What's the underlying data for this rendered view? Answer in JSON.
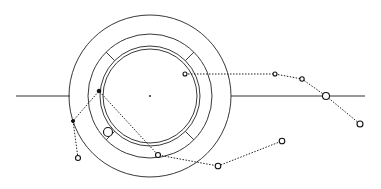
{
  "diagram": {
    "type": "orbital-trajectory-schematic",
    "center": {
      "x": 150,
      "y": 96
    },
    "rings": [
      {
        "name": "outer-ring",
        "r": 81
      },
      {
        "name": "segment-ring",
        "r": 62
      },
      {
        "name": "inner-ring-outer-edge",
        "r": 50
      },
      {
        "name": "inner-ring-inner-edge",
        "r": 47
      }
    ],
    "segment_dividers_deg": [
      45,
      135,
      225,
      315
    ],
    "axis_lines": [
      {
        "name": "left-axis",
        "x1": 16,
        "x2": 70,
        "y": 96
      },
      {
        "name": "right-axis",
        "x1": 231,
        "x2": 365,
        "y": 96
      }
    ],
    "trajectories": [
      {
        "name": "trajectory-right",
        "points": [
          {
            "x": 185,
            "y": 74,
            "r": 2,
            "style": "open"
          },
          {
            "x": 275,
            "y": 74,
            "r": 2,
            "style": "open"
          },
          {
            "x": 302,
            "y": 79,
            "r": 2.2,
            "style": "open"
          },
          {
            "x": 326,
            "y": 96,
            "r": 3.5,
            "style": "open"
          },
          {
            "x": 360,
            "y": 124,
            "r": 3,
            "style": "open"
          }
        ]
      },
      {
        "name": "trajectory-left",
        "points": [
          {
            "x": 78,
            "y": 158,
            "r": 2.5,
            "style": "open"
          },
          {
            "x": 73,
            "y": 121,
            "r": 1.5,
            "style": "filled"
          },
          {
            "x": 99,
            "y": 91,
            "r": 1.8,
            "style": "filled"
          },
          {
            "x": 158,
            "y": 155,
            "r": 2.5,
            "style": "open"
          },
          {
            "x": 218,
            "y": 166,
            "r": 2.8,
            "style": "open"
          },
          {
            "x": 282,
            "y": 141,
            "r": 2.8,
            "style": "open"
          }
        ]
      }
    ],
    "markers": [
      {
        "name": "large-marker",
        "x": 108,
        "y": 132,
        "r": 4.5,
        "style": "open"
      }
    ]
  }
}
